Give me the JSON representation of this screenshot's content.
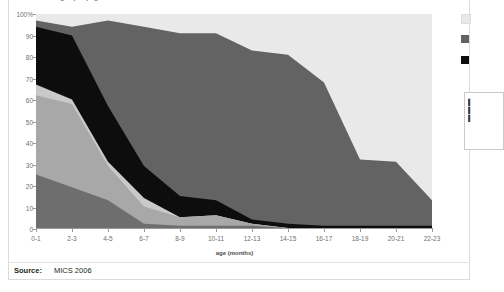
{
  "figure": {
    "title_fragment": "grap    l      p g",
    "axis_title": "age (months)",
    "source_label": "Source:",
    "source_value": "MICS 2006"
  },
  "legend": {
    "items": [
      {
        "swatch_name": "legend-swatch-light",
        "color": "#e9e9e9",
        "label": ""
      },
      {
        "swatch_name": "legend-swatch-gray",
        "color": "#636363",
        "label": ""
      },
      {
        "swatch_name": "legend-swatch-black",
        "color": "#0d0d0d",
        "label": ""
      }
    ]
  },
  "note_panel": {
    "lines": [
      "",
      "",
      ""
    ]
  },
  "chart_data": {
    "type": "area",
    "stacked": true,
    "title": "",
    "xlabel": "age (months)",
    "ylabel": "",
    "ylim": [
      0,
      100
    ],
    "ytick_labels": [
      "100%",
      "90",
      "80",
      "70",
      "60",
      "50",
      "40",
      "30",
      "20",
      "10",
      "0"
    ],
    "ytick_values": [
      100,
      90,
      80,
      70,
      60,
      50,
      40,
      30,
      20,
      10,
      0
    ],
    "grid": false,
    "legend_position": "right",
    "categories": [
      "0-1",
      "2-3",
      "4-5",
      "6-7",
      "8-9",
      "10-11",
      "12-13",
      "14-15",
      "16-17",
      "18-19",
      "20-21",
      "22-23"
    ],
    "x": [
      "0-1",
      "2-3",
      "4-5",
      "6-7",
      "8-9",
      "10-11",
      "12-13",
      "14-15",
      "16-17",
      "18-19",
      "20-21",
      "22-23"
    ],
    "series": [
      {
        "name": "bottom-band",
        "color": "#6e6e6e",
        "values": [
          25,
          19,
          13,
          2,
          1,
          1,
          1,
          0,
          0,
          0,
          0,
          0
        ]
      },
      {
        "name": "second-band",
        "color": "#a8a8a8",
        "values": [
          37,
          39,
          16,
          8,
          4,
          5,
          1,
          0,
          0,
          0,
          0,
          0
        ]
      },
      {
        "name": "third-band",
        "color": "#c9c9c9",
        "values": [
          5,
          2,
          2,
          4,
          0,
          0,
          0,
          0,
          0,
          0,
          0,
          0
        ]
      },
      {
        "name": "black-band",
        "color": "#0d0d0d",
        "values": [
          27,
          30,
          26,
          15,
          10,
          7,
          2,
          2,
          1,
          1,
          1,
          1
        ]
      },
      {
        "name": "gray-band",
        "color": "#636363",
        "values": [
          3,
          4,
          40,
          65,
          76,
          78,
          79,
          79,
          67,
          31,
          30,
          12
        ]
      }
    ],
    "cumulative_tops": {
      "bottom-band": [
        25,
        19,
        13,
        2,
        1,
        1,
        1,
        0,
        0,
        0,
        0,
        0
      ],
      "second-band": [
        62,
        58,
        29,
        10,
        5,
        6,
        2,
        0,
        0,
        0,
        0,
        0
      ],
      "third-band": [
        67,
        60,
        31,
        14,
        5,
        6,
        2,
        0,
        0,
        0,
        0,
        0
      ],
      "black-band": [
        94,
        90,
        57,
        29,
        15,
        13,
        4,
        2,
        1,
        1,
        1,
        1
      ],
      "gray-band": [
        97,
        94,
        97,
        94,
        91,
        91,
        83,
        81,
        68,
        32,
        31,
        13
      ]
    }
  }
}
